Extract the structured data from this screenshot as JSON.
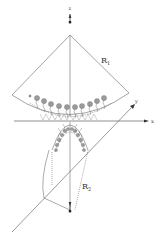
{
  "diagram": {
    "labels": {
      "z_axis": "z",
      "x_axis": "x",
      "y_axis": "y",
      "radius_1": "R",
      "radius_1_sub": "1",
      "radius_2": "R",
      "radius_2_sub": "2"
    },
    "colors": {
      "line": "#555555",
      "head_fill": "#9a9a9a",
      "background": "#ffffff"
    },
    "upper_cap": {
      "head_count": 11,
      "description": "lipid molecules arranged on concave spherical surface with radius R1"
    },
    "lower_cap": {
      "head_count": 12,
      "description": "lipid molecules arranged on convex surface with radius R2"
    }
  }
}
